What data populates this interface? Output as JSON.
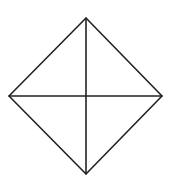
{
  "diagram": {
    "shape": "rhombus-with-diagonals",
    "stroke_color": "#222222",
    "background": "#ffffff",
    "vertices": {
      "top": [
        86,
        18
      ],
      "left": [
        9,
        96
      ],
      "right": [
        162,
        96
      ],
      "bottom": [
        86,
        174
      ]
    },
    "center": [
      86,
      96
    ]
  }
}
